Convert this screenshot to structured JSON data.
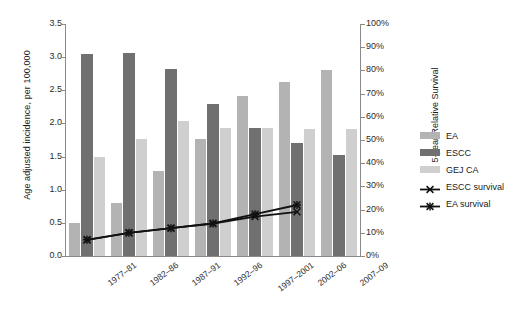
{
  "chart_data": {
    "type": "bar",
    "title": "",
    "xlabel": "",
    "ylabel": "Age adjusted incidence, per 100,000",
    "y2label": "5-year Relative Survival",
    "ylim": [
      0,
      3.5
    ],
    "y2lim": [
      0,
      100
    ],
    "grid": false,
    "legend_position": "right",
    "categories": [
      "1977–81",
      "1982–86",
      "1987–91",
      "1992–96",
      "1997–2001",
      "2002–06",
      "2007–09"
    ],
    "y_ticks": [
      "0.0",
      "0.5",
      "1.0",
      "1.5",
      "2.0",
      "2.5",
      "3.0",
      "3.5"
    ],
    "y2_ticks": [
      "0%",
      "10%",
      "20%",
      "30%",
      "40%",
      "50%",
      "60%",
      "70%",
      "80%",
      "90%",
      "100%"
    ],
    "series": [
      {
        "name": "EA",
        "kind": "bar",
        "axis": "left",
        "color": "#b3b3b3",
        "values": [
          0.5,
          0.8,
          1.28,
          1.77,
          2.42,
          2.62,
          2.8
        ]
      },
      {
        "name": "ESCC",
        "kind": "bar",
        "axis": "left",
        "color": "#707070",
        "values": [
          3.05,
          3.07,
          2.82,
          2.3,
          1.93,
          1.7,
          1.52
        ]
      },
      {
        "name": "GEJ CA",
        "kind": "bar",
        "axis": "left",
        "color": "#cfcfcf",
        "values": [
          1.5,
          1.76,
          2.03,
          1.93,
          1.93,
          1.92,
          1.92
        ]
      },
      {
        "name": "ESCC survival",
        "kind": "line",
        "axis": "right",
        "color": "#111111",
        "marker": "x",
        "values": [
          7,
          10,
          12,
          14,
          17,
          19,
          null
        ]
      },
      {
        "name": "EA survival",
        "kind": "line",
        "axis": "right",
        "color": "#111111",
        "marker": "asterisk",
        "values": [
          7,
          10,
          12,
          14,
          18,
          22,
          null
        ]
      }
    ]
  },
  "legend": {
    "items": [
      {
        "label": "EA",
        "type": "swatch",
        "swatch": "ea"
      },
      {
        "label": "ESCC",
        "type": "swatch",
        "swatch": "escc"
      },
      {
        "label": "GEJ CA",
        "type": "swatch",
        "swatch": "gej"
      },
      {
        "label": "ESCC survival",
        "type": "line",
        "marker": "x"
      },
      {
        "label": "EA survival",
        "type": "line",
        "marker": "asterisk"
      }
    ]
  }
}
